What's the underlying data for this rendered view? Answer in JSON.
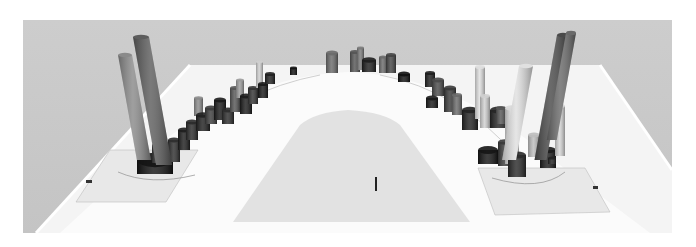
{
  "scene": {
    "description": "3D rendering of a U-shaped curved track with clusters of extruded columns along both arms and the bend",
    "colors": {
      "page_bg": "#ffffff",
      "backdrop": "#c9c9c9",
      "track_surface": "#fafafa",
      "inner_field": "#e3e3e3",
      "zone_pad": "#e6e6e6",
      "outline": "#9a9a9a",
      "column_dark": "#1c1c1c",
      "column_mid": "#5a5a5a",
      "column_light": "#e8e8e8"
    },
    "backdrop_rect": {
      "x": 23,
      "y": 20,
      "w": 649,
      "h": 213
    },
    "left_cluster": {
      "tall_columns": [
        {
          "x": 118,
          "top": 55,
          "bottom": 160,
          "w": 14,
          "shade": "#8a8a8a"
        },
        {
          "x": 133,
          "top": 37,
          "bottom": 165,
          "w": 16,
          "shade": "#5d5d5d"
        }
      ],
      "blocks": [
        {
          "x": 137,
          "y": 160,
          "w": 36,
          "h": 14,
          "shade": "#141414"
        },
        {
          "x": 152,
          "y": 145,
          "w": 14,
          "h": 18,
          "shade": "#3a3a3a"
        },
        {
          "x": 168,
          "y": 140,
          "w": 12,
          "h": 22,
          "shade": "#2e2e2e"
        },
        {
          "x": 178,
          "y": 130,
          "w": 12,
          "h": 20,
          "shade": "#1e1e1e"
        },
        {
          "x": 186,
          "y": 122,
          "w": 12,
          "h": 18,
          "shade": "#2a2a2a"
        },
        {
          "x": 194,
          "y": 98,
          "w": 9,
          "h": 18,
          "shade": "#8a8a8a"
        },
        {
          "x": 196,
          "y": 115,
          "w": 14,
          "h": 16,
          "shade": "#202020"
        },
        {
          "x": 205,
          "y": 108,
          "w": 12,
          "h": 16,
          "shade": "#3c3c3c"
        },
        {
          "x": 214,
          "y": 100,
          "w": 12,
          "h": 20,
          "shade": "#1a1a1a"
        },
        {
          "x": 222,
          "y": 110,
          "w": 12,
          "h": 14,
          "shade": "#2c2c2c"
        },
        {
          "x": 230,
          "y": 88,
          "w": 10,
          "h": 24,
          "shade": "#555555"
        },
        {
          "x": 236,
          "y": 80,
          "w": 8,
          "h": 18,
          "shade": "#9a9a9a"
        },
        {
          "x": 240,
          "y": 96,
          "w": 12,
          "h": 18,
          "shade": "#1c1c1c"
        },
        {
          "x": 248,
          "y": 88,
          "w": 10,
          "h": 16,
          "shade": "#333333"
        },
        {
          "x": 256,
          "y": 62,
          "w": 7,
          "h": 26,
          "shade": "#cfcfcf"
        },
        {
          "x": 258,
          "y": 84,
          "w": 10,
          "h": 14,
          "shade": "#1a1a1a"
        },
        {
          "x": 265,
          "y": 74,
          "w": 10,
          "h": 10,
          "shade": "#202020"
        },
        {
          "x": 290,
          "y": 68,
          "w": 7,
          "h": 7,
          "shade": "#111111"
        }
      ]
    },
    "center_cluster": {
      "blocks": [
        {
          "x": 326,
          "y": 53,
          "w": 12,
          "h": 20,
          "shade": "#6a6a6a"
        },
        {
          "x": 350,
          "y": 52,
          "w": 10,
          "h": 20,
          "shade": "#555555"
        },
        {
          "x": 357,
          "y": 48,
          "w": 7,
          "h": 22,
          "shade": "#7a7a7a"
        },
        {
          "x": 362,
          "y": 60,
          "w": 14,
          "h": 12,
          "shade": "#1e1e1e"
        },
        {
          "x": 379,
          "y": 57,
          "w": 8,
          "h": 16,
          "shade": "#6a6a6a"
        },
        {
          "x": 386,
          "y": 55,
          "w": 10,
          "h": 18,
          "shade": "#444444"
        },
        {
          "x": 398,
          "y": 74,
          "w": 12,
          "h": 8,
          "shade": "#111111"
        }
      ]
    },
    "right_cluster": {
      "tall_columns": [
        {
          "x": 557,
          "top": 35,
          "bottom": 160,
          "w": 12,
          "shade": "#4a4a4a"
        },
        {
          "x": 566,
          "top": 33,
          "bottom": 140,
          "w": 10,
          "shade": "#6a6a6a"
        },
        {
          "x": 519,
          "top": 66,
          "bottom": 160,
          "w": 14,
          "shade": "#e0e0e0"
        }
      ],
      "blocks": [
        {
          "x": 425,
          "y": 73,
          "w": 10,
          "h": 14,
          "shade": "#1e1e1e"
        },
        {
          "x": 432,
          "y": 80,
          "w": 12,
          "h": 16,
          "shade": "#4a4a4a"
        },
        {
          "x": 426,
          "y": 98,
          "w": 12,
          "h": 10,
          "shade": "#1a1a1a"
        },
        {
          "x": 444,
          "y": 88,
          "w": 12,
          "h": 24,
          "shade": "#3a3a3a"
        },
        {
          "x": 452,
          "y": 95,
          "w": 10,
          "h": 20,
          "shade": "#6a6a6a"
        },
        {
          "x": 462,
          "y": 110,
          "w": 16,
          "h": 20,
          "shade": "#222222"
        },
        {
          "x": 475,
          "y": 67,
          "w": 10,
          "h": 52,
          "shade": "#dedede"
        },
        {
          "x": 480,
          "y": 96,
          "w": 10,
          "h": 32,
          "shade": "#cfcfcf"
        },
        {
          "x": 490,
          "y": 110,
          "w": 18,
          "h": 18,
          "shade": "#262626"
        },
        {
          "x": 496,
          "y": 108,
          "w": 10,
          "h": 16,
          "shade": "#555555"
        },
        {
          "x": 478,
          "y": 150,
          "w": 20,
          "h": 14,
          "shade": "#151515"
        },
        {
          "x": 498,
          "y": 142,
          "w": 14,
          "h": 24,
          "shade": "#3a3a3a"
        },
        {
          "x": 505,
          "y": 108,
          "w": 14,
          "h": 56,
          "shade": "#d8d8d8"
        },
        {
          "x": 508,
          "y": 155,
          "w": 18,
          "h": 22,
          "shade": "#2a2a2a"
        },
        {
          "x": 528,
          "y": 135,
          "w": 12,
          "h": 22,
          "shade": "#bdbdbd"
        },
        {
          "x": 540,
          "y": 150,
          "w": 16,
          "h": 18,
          "shade": "#1c1c1c"
        },
        {
          "x": 555,
          "y": 106,
          "w": 10,
          "h": 50,
          "shade": "#d5d5d5"
        },
        {
          "x": 548,
          "y": 158,
          "w": 8,
          "h": 6,
          "shade": "#222222"
        }
      ]
    },
    "markers": [
      {
        "x": 375,
        "y": 177,
        "w": 2,
        "h": 14,
        "shade": "#222222"
      },
      {
        "x": 86,
        "y": 180,
        "w": 6,
        "h": 3,
        "shade": "#333333"
      },
      {
        "x": 593,
        "y": 186,
        "w": 5,
        "h": 3,
        "shade": "#333333"
      }
    ]
  }
}
